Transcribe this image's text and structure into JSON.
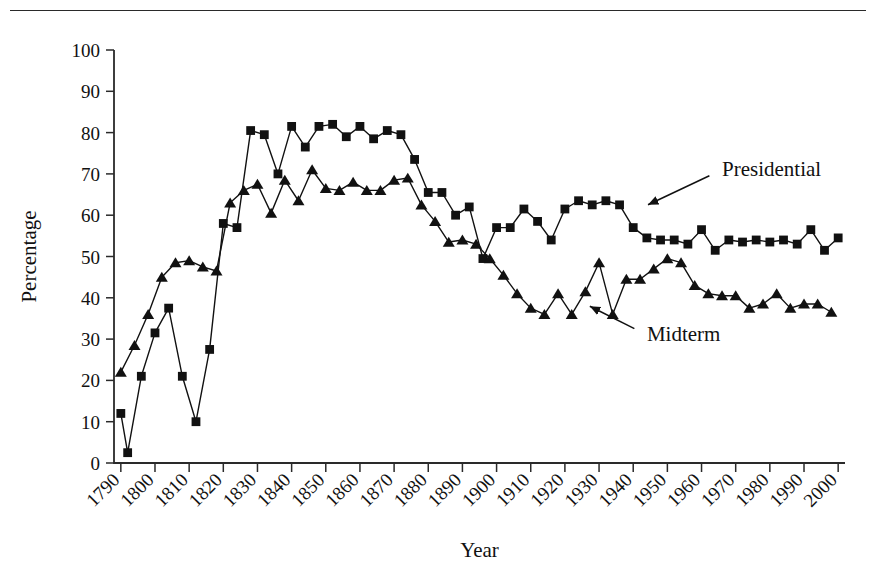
{
  "figure": {
    "background": "#ffffff",
    "ink_color": "#111111",
    "has_top_rule": true
  },
  "chart_data": {
    "type": "line",
    "title": "",
    "subtitle": "",
    "xlabel": "Year",
    "ylabel": "Percentage",
    "xlim": [
      1788,
      2002
    ],
    "ylim": [
      0,
      100
    ],
    "yticks": [
      0,
      10,
      20,
      30,
      40,
      50,
      60,
      70,
      80,
      90,
      100
    ],
    "ytick_labels": [
      "0",
      "10",
      "20",
      "30",
      "40",
      "50",
      "60",
      "70",
      "80",
      "90",
      "100"
    ],
    "xticks": [
      1790,
      1800,
      1810,
      1820,
      1830,
      1840,
      1850,
      1860,
      1870,
      1880,
      1890,
      1900,
      1910,
      1920,
      1930,
      1940,
      1950,
      1960,
      1970,
      1980,
      1990,
      2000
    ],
    "xtick_labels": [
      "1790",
      "1800",
      "1810",
      "1820",
      "1830",
      "1840",
      "1850",
      "1860",
      "1870",
      "1880",
      "1890",
      "1900",
      "1910",
      "1920",
      "1930",
      "1940",
      "1950",
      "1960",
      "1970",
      "1980",
      "1990",
      "2000"
    ],
    "xtick_rotation_deg": 45,
    "grid": false,
    "legend_position": "inline-annotations",
    "series": [
      {
        "name": "Presidential",
        "marker": "square",
        "color": "#111111",
        "annotation": {
          "label": "Presidential",
          "text_x": 1966,
          "text_y": 71,
          "arrow_to_x": 1943,
          "arrow_to_y": 62
        },
        "x": [
          1790,
          1792,
          1796,
          1800,
          1804,
          1808,
          1812,
          1816,
          1820,
          1824,
          1828,
          1832,
          1836,
          1840,
          1844,
          1848,
          1852,
          1856,
          1860,
          1864,
          1868,
          1872,
          1876,
          1880,
          1884,
          1888,
          1892,
          1896,
          1900,
          1904,
          1908,
          1912,
          1916,
          1920,
          1924,
          1928,
          1932,
          1936,
          1940,
          1944,
          1948,
          1952,
          1956,
          1960,
          1964,
          1968,
          1972,
          1976,
          1980,
          1984,
          1988,
          1992,
          1996,
          2000
        ],
        "y": [
          12,
          2.5,
          21,
          31.5,
          37.5,
          21,
          10,
          27.5,
          58,
          57,
          80.5,
          79.5,
          70,
          81.5,
          76.5,
          81.5,
          82,
          79,
          81.5,
          78.5,
          80.5,
          79.5,
          73.5,
          65.5,
          65.5,
          60,
          62,
          49.5,
          57,
          57,
          61.5,
          58.5,
          54,
          61.5,
          63.5,
          62.5,
          63.5,
          62.5,
          57,
          54.5,
          54,
          54,
          53,
          56.5,
          51.5,
          54,
          53.5,
          54,
          53.5,
          54,
          53,
          56.5,
          51.5,
          54.5
        ],
        "values_note": "turnout percentage at presidential elections"
      },
      {
        "name": "Midterm",
        "marker": "triangle",
        "color": "#111111",
        "annotation": {
          "label": "Midterm",
          "text_x": 1944,
          "text_y": 31,
          "arrow_to_x": 1926,
          "arrow_to_y": 38.5
        },
        "x": [
          1790,
          1794,
          1798,
          1802,
          1806,
          1810,
          1814,
          1818,
          1822,
          1826,
          1830,
          1834,
          1838,
          1842,
          1846,
          1850,
          1854,
          1858,
          1862,
          1866,
          1870,
          1874,
          1878,
          1882,
          1886,
          1890,
          1894,
          1898,
          1902,
          1906,
          1910,
          1914,
          1918,
          1922,
          1926,
          1930,
          1934,
          1938,
          1942,
          1946,
          1950,
          1954,
          1958,
          1962,
          1966,
          1970,
          1974,
          1978,
          1982,
          1986,
          1990,
          1994,
          1998
        ],
        "y": [
          22,
          28.5,
          36,
          45,
          48.5,
          49,
          47.5,
          46.5,
          63,
          66,
          67.5,
          60.5,
          68.5,
          63.5,
          71,
          66.5,
          66,
          68,
          66,
          66,
          68.5,
          69,
          62.5,
          58.5,
          53.5,
          54,
          53,
          49.5,
          45.5,
          41,
          37.5,
          36,
          41,
          36,
          41.5,
          48.5,
          36,
          44.5,
          44.5,
          47,
          49.5,
          48.5,
          43,
          41,
          40.5,
          40.5,
          37.5,
          38.5,
          41,
          37.5,
          38.5,
          38.5,
          36.5
        ],
        "values_note": "turnout percentage at midterm elections"
      }
    ]
  }
}
